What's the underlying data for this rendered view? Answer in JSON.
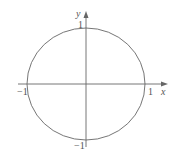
{
  "figure": {
    "axes": {
      "x_label": "x",
      "y_label": "y",
      "origin": [
        86,
        84
      ],
      "x_axis": {
        "from": 18,
        "to": 167
      },
      "y_axis": {
        "from": 147,
        "to": 12
      }
    },
    "ticks": {
      "x_pos": "1",
      "x_neg": "−1",
      "y_pos": "1",
      "y_neg": "−1"
    },
    "curve": {
      "type": "circle",
      "equation": "x^2 + y^2 = 1",
      "center": [
        86,
        84
      ],
      "rx": 59,
      "ry": 56
    },
    "colors": {
      "stroke": "#666666",
      "text": "#555555"
    }
  }
}
